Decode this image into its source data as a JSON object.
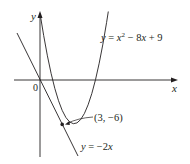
{
  "diagram": {
    "axes": {
      "x_label": "x",
      "y_label": "y",
      "origin_label": "0"
    },
    "curves": [
      {
        "name": "parabola",
        "label_lhs": "y",
        "label_eq": " = ",
        "label_rhs_a": "x",
        "label_sup": "2",
        "label_rhs_b": " − 8",
        "label_rhs_c": "x",
        "label_rhs_d": " + 9",
        "equation": "y = x^2 - 8x + 9"
      },
      {
        "name": "tangent-line",
        "label_lhs": "y",
        "label_eq": " = −2",
        "label_rhs": "x",
        "equation": "y = -2x"
      }
    ],
    "point": {
      "label": "(3, −6)",
      "x": 3,
      "y": -6
    },
    "colors": {
      "stroke": "#231f20",
      "background": "#ffffff"
    }
  }
}
